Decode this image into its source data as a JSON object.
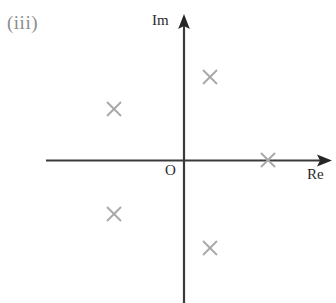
{
  "figure": {
    "part_label": "(iii)",
    "origin_label": "O",
    "background_color": "#ffffff"
  },
  "axes": {
    "imaginary": {
      "label": "Im",
      "icon": "up-arrow-icon",
      "color": "#2b2b2b"
    },
    "real": {
      "label": "Re",
      "icon": "right-arrow-icon",
      "color": "#2b2b2b"
    }
  },
  "chart_data": {
    "type": "scatter",
    "title": "(iii)",
    "xlabel": "Re",
    "ylabel": "Im",
    "grid": false,
    "legend": "none",
    "marker": "cross-x",
    "marker_color": "#a9a9a9",
    "marker_size_px": 14,
    "xlim": [
      -1.6,
      1.75
    ],
    "ylim": [
      -1.7,
      1.7
    ],
    "origin_px": {
      "x": 183,
      "y": 160
    },
    "units_per_pixel": 0.0118,
    "pixels_per_unit": 85,
    "points": [
      {
        "label": "z1",
        "re": 0.31,
        "im": 0.98,
        "px": 210,
        "py": 77
      },
      {
        "label": "z2",
        "re": -0.81,
        "im": 0.6,
        "px": 114,
        "py": 109
      },
      {
        "label": "z3",
        "re": 1.0,
        "im": 0.0,
        "px": 268,
        "py": 160
      },
      {
        "label": "z4",
        "re": -0.81,
        "im": -0.64,
        "px": 114,
        "py": 214
      },
      {
        "label": "z5",
        "re": 0.31,
        "im": -1.04,
        "px": 210,
        "py": 248
      }
    ]
  }
}
